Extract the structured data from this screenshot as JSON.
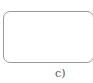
{
  "panel": {
    "label": "c)"
  },
  "colors": {
    "border": "#9a9a9a",
    "label": "#555555",
    "background": "#ffffff"
  }
}
